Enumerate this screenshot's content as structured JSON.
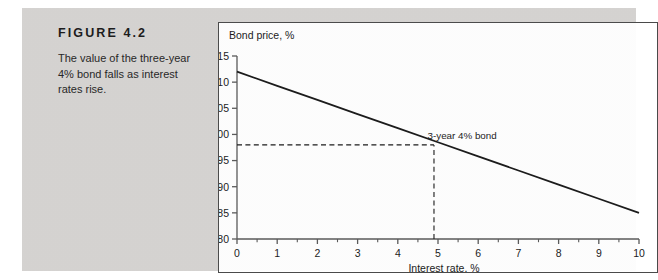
{
  "figure": {
    "label": "FIGURE 4.2",
    "caption": "The value of the three-year 4% bond falls as interest rates rise."
  },
  "chart_data": {
    "type": "line",
    "title": "",
    "xlabel": "Interest rate, %",
    "ylabel": "Bond price, %",
    "xlim": [
      0,
      10
    ],
    "ylim": [
      80,
      115
    ],
    "xticks": [
      "0",
      "1",
      "2",
      "3",
      "4",
      "5",
      "6",
      "7",
      "8",
      "9",
      "10"
    ],
    "yticks": [
      "80",
      "85",
      "90",
      "95",
      "100",
      "105",
      "110",
      "115"
    ],
    "xtick_values": [
      0,
      1,
      2,
      3,
      4,
      5,
      6,
      7,
      8,
      9,
      10
    ],
    "ytick_values": [
      80,
      85,
      90,
      95,
      100,
      105,
      110,
      115
    ],
    "minor_xticks": [
      0.5,
      1.5,
      2.5,
      3.5,
      4.5,
      5.5,
      6.5,
      7.5,
      8.5,
      9.5
    ],
    "grid": false,
    "legend_position": "none",
    "series": [
      {
        "name": "3-year 4% bond",
        "x": [
          0,
          1,
          2,
          3,
          4,
          5,
          6,
          7,
          8,
          9,
          10
        ],
        "values": [
          112.0,
          109.3,
          106.6,
          103.9,
          101.2,
          98.5,
          95.8,
          93.1,
          90.4,
          87.7,
          85.0
        ],
        "color": "#1a1a1a"
      }
    ],
    "annotations": [
      {
        "text": "3-year 4% bond",
        "x": 5.6,
        "y": 99.2,
        "name": "series-annotation"
      }
    ],
    "reference_lines": [
      {
        "name": "price-reference-line",
        "orientation": "horizontal",
        "value": 98,
        "from_x": 0,
        "to_x": 4.9,
        "style": "dashed"
      },
      {
        "name": "rate-reference-line",
        "orientation": "vertical",
        "value": 4.9,
        "from_y": 80,
        "to_y": 98,
        "style": "dashed"
      }
    ]
  },
  "colors": {
    "panel_background": "#d6d4d2",
    "chart_background": "#ffffff",
    "chart_border": "#4a4a4a",
    "line": "#1a1a1a",
    "axis": "#5a5a5a",
    "text": "#1a1a1a"
  }
}
